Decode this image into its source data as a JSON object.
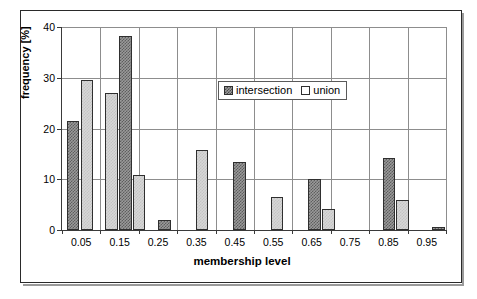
{
  "chart_data": {
    "type": "bar",
    "title": "",
    "xlabel": "membership level",
    "ylabel": "frequency [%]",
    "xlim": [
      0.0,
      1.0
    ],
    "ylim": [
      0,
      40
    ],
    "yticks": [
      0,
      10,
      20,
      30,
      40
    ],
    "xticks": [
      0.05,
      0.15,
      0.25,
      0.35,
      0.45,
      0.55,
      0.65,
      0.75,
      0.85,
      0.95
    ],
    "grid": true,
    "legend_position": "upper center",
    "categories": [
      0.05,
      0.15,
      0.25,
      0.35,
      0.45,
      0.55,
      0.65,
      0.75,
      0.85,
      0.95
    ],
    "series": [
      {
        "name": "intersection",
        "color": "#6e6e6e",
        "values": [
          21.5,
          38.2,
          2.0,
          13.5,
          0.0,
          10.0,
          0.0,
          14.2,
          0.0,
          0.5
        ]
      },
      {
        "name": "union",
        "color": "#d7d7d7",
        "values": [
          29.5,
          27.0,
          10.8,
          15.7,
          6.5,
          4.1,
          0.0,
          6.0,
          0.0,
          0.0
        ]
      }
    ],
    "bars": [
      {
        "x_label": "0.05",
        "series": "intersection",
        "value": 21.5,
        "left_pct": 1.2,
        "width_pct": 3.3
      },
      {
        "x_label": "0.05",
        "series": "union",
        "value": 29.5,
        "left_pct": 4.9,
        "width_pct": 3.3
      },
      {
        "x_label": "0.15",
        "series": "union",
        "value": 27.0,
        "left_pct": 11.2,
        "width_pct": 3.3
      },
      {
        "x_label": "0.15",
        "series": "intersection",
        "value": 38.2,
        "left_pct": 14.8,
        "width_pct": 3.3
      },
      {
        "x_label": "0.15",
        "series": "union",
        "value": 10.8,
        "left_pct": 18.4,
        "width_pct": 3.3
      },
      {
        "x_label": "0.25",
        "series": "intersection",
        "value": 2.0,
        "left_pct": 25.0,
        "width_pct": 3.3
      },
      {
        "x_label": "0.33",
        "series": "union",
        "value": 15.7,
        "left_pct": 34.8,
        "width_pct": 3.3
      },
      {
        "x_label": "0.40",
        "series": "intersection",
        "value": 13.5,
        "left_pct": 44.5,
        "width_pct": 3.3
      },
      {
        "x_label": "0.46",
        "series": "union",
        "value": 6.5,
        "left_pct": 54.3,
        "width_pct": 3.3
      },
      {
        "x_label": "0.58",
        "series": "intersection",
        "value": 10.0,
        "left_pct": 64.1,
        "width_pct": 3.3
      },
      {
        "x_label": "0.62",
        "series": "union",
        "value": 4.1,
        "left_pct": 67.7,
        "width_pct": 3.3
      },
      {
        "x_label": "0.79",
        "series": "intersection",
        "value": 14.2,
        "left_pct": 83.5,
        "width_pct": 3.3
      },
      {
        "x_label": "0.83",
        "series": "union",
        "value": 6.0,
        "left_pct": 87.1,
        "width_pct": 3.3
      },
      {
        "x_label": "0.99",
        "series": "intersection",
        "value": 0.5,
        "left_pct": 96.4,
        "width_pct": 3.3
      }
    ]
  },
  "axis": {
    "y_title": "frequency [%]",
    "x_title": "membership level",
    "y_tick_labels": [
      "0",
      "10",
      "20",
      "30",
      "40"
    ],
    "x_tick_labels": [
      "0.05",
      "0.15",
      "0.25",
      "0.35",
      "0.45",
      "0.55",
      "0.65",
      "0.75",
      "0.85",
      "0.95"
    ]
  },
  "legend": {
    "items": [
      {
        "label": "intersection",
        "swatch": "intersection"
      },
      {
        "label": "union",
        "swatch": "union"
      }
    ]
  }
}
